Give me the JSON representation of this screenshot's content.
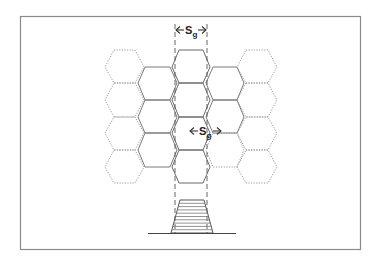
{
  "figure": {
    "labels": {
      "top_spacing": {
        "main": "S",
        "sub": "g"
      },
      "middle_spacing": {
        "main": "S",
        "sub": "g"
      }
    },
    "colors": {
      "frame": "#8a8a8a",
      "hex_outer": "#9a9a9a",
      "hex_center": "#6a6a6a",
      "guide": "#555555",
      "text": "#222222"
    },
    "grid": {
      "outer_columns": 2,
      "hexes_per_outer_column": 4,
      "center_column_hexes": 4,
      "offset_columns": 2,
      "hexes_per_offset_column": 3
    },
    "profile": {
      "shape": "trapezoid",
      "stripes": 10
    }
  }
}
